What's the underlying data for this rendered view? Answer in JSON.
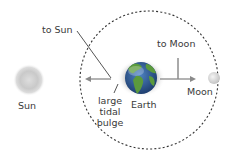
{
  "diagram": {
    "labels": {
      "to_sun": "to Sun",
      "sun": "Sun",
      "to_moon": "to Moon",
      "earth": "Earth",
      "moon": "Moon",
      "bulge_line1": "large",
      "bulge_line2": "tidal",
      "bulge_line3": "bulge"
    },
    "colors": {
      "orbit": "#333333",
      "line": "#555555",
      "arrow": "#8a8a8a",
      "sun": "#cfcfcf",
      "moon": "#e0e0e0",
      "earth_land": "#5a8f3a",
      "earth_ocean": "#2f5fa0",
      "text": "#3a3a3a"
    }
  }
}
